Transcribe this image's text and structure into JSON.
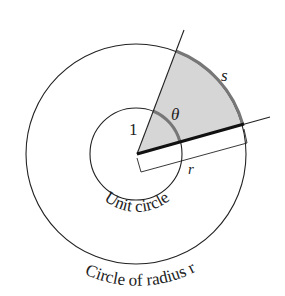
{
  "diagram": {
    "labels": {
      "unit_radius": "1",
      "angle": "θ",
      "arc_length": "s",
      "radius": "r",
      "unit_circle": "Unit circle",
      "outer_circle": "Circle of radius r"
    },
    "colors": {
      "stroke": "#222222",
      "sector_fill": "#d6d6d6",
      "arc_highlight": "#777777"
    }
  }
}
